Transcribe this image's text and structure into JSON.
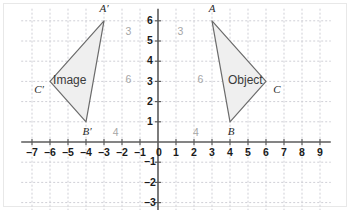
{
  "figure": {
    "background_color": "#ffffff",
    "border_color": "#e8e8e8"
  },
  "grid": {
    "origin_px": {
      "x": 158,
      "y": 142
    },
    "unit_px": {
      "x": 18.0,
      "y": 20.2
    },
    "x_min": -7.6,
    "x_max": 9.6,
    "y_min": -3.6,
    "y_max": 6.6,
    "gridline_color": "#cfcfd6",
    "axis_color": "#5b5b5b",
    "grid_visible": true
  },
  "axes": {
    "x_label": "",
    "y_label": "",
    "x_ticks": [
      -7,
      -6,
      -5,
      -4,
      -3,
      -2,
      -1,
      0,
      1,
      2,
      3,
      4,
      5,
      6,
      7,
      8,
      9
    ],
    "x_tick_labels": [
      "–7",
      "–6",
      "–5",
      "–4",
      "–3",
      "–2",
      "–1",
      "0",
      "1",
      "2",
      "3",
      "4",
      "5",
      "6",
      "7",
      "8",
      "9"
    ],
    "y_ticks": [
      6,
      5,
      4,
      3,
      2,
      1,
      -1,
      -2,
      -3
    ],
    "y_tick_labels": [
      "6",
      "5",
      "4",
      "3",
      "2",
      "1",
      "–1",
      "–2",
      "–3"
    ]
  },
  "chart_data": {
    "type": "scatter",
    "xlabel": "",
    "ylabel": "",
    "xlim": [
      -7.6,
      9.6
    ],
    "ylim": [
      -3.6,
      6.6
    ],
    "grid": true,
    "legend": "none",
    "series": [
      {
        "name": "Object",
        "label": "Object",
        "label_point": {
          "x": 4.85,
          "y": 3.05
        },
        "fill": "#efefef",
        "stroke": "#6b6b6b",
        "points": [
          {
            "name": "A",
            "x": 3,
            "y": 6,
            "label": "A",
            "label_offset_px": {
              "x": 0,
              "y": -11
            }
          },
          {
            "name": "B",
            "x": 4,
            "y": 1,
            "label": "B",
            "label_offset_px": {
              "x": 1,
              "y": 11
            }
          },
          {
            "name": "C",
            "x": 6,
            "y": 3,
            "label": "C",
            "label_offset_px": {
              "x": 11,
              "y": 9
            }
          }
        ]
      },
      {
        "name": "Image",
        "label": "Image",
        "label_point": {
          "x": -4.9,
          "y": 3.05
        },
        "fill": "#efefef",
        "stroke": "#6b6b6b",
        "points": [
          {
            "name": "A'",
            "x": -3,
            "y": 6,
            "label": "A′",
            "label_offset_px": {
              "x": 0,
              "y": -11
            }
          },
          {
            "name": "B'",
            "x": -4,
            "y": 1,
            "label": "B′",
            "label_offset_px": {
              "x": 1,
              "y": 11
            }
          },
          {
            "name": "C'",
            "x": -6,
            "y": 3,
            "label": "C′",
            "label_offset_px": {
              "x": -11,
              "y": 9
            }
          }
        ]
      }
    ],
    "annotations": [
      {
        "text": "3",
        "x": 1.25,
        "y": 5.45,
        "role": "dimension-right-top"
      },
      {
        "text": "6",
        "x": 2.35,
        "y": 3.05,
        "role": "dimension-right-mid"
      },
      {
        "text": "4",
        "x": 2.1,
        "y": 0.45,
        "role": "dimension-right-bottom"
      },
      {
        "text": "3",
        "x": -1.65,
        "y": 5.45,
        "role": "dimension-left-top"
      },
      {
        "text": "6",
        "x": -1.65,
        "y": 3.05,
        "role": "dimension-left-mid"
      },
      {
        "text": "4",
        "x": -2.35,
        "y": 0.45,
        "role": "dimension-left-bottom"
      }
    ]
  }
}
